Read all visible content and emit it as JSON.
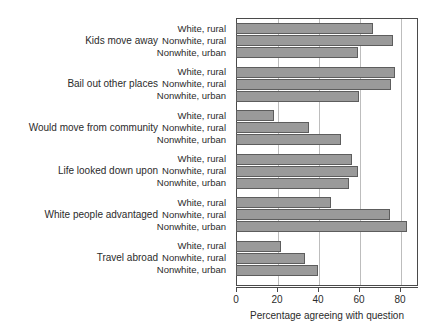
{
  "chart_data": {
    "type": "bar",
    "orientation": "horizontal",
    "title": "",
    "subtitle": "",
    "xlabel": "Percentage agreeing with question",
    "ylabel": "",
    "xlim": [
      0,
      88.9
    ],
    "xticks": [
      0,
      20,
      40,
      60,
      80
    ],
    "xticklabels": [
      "0",
      "20",
      "40",
      "60",
      "80"
    ],
    "grid": "vertical",
    "legend": "none",
    "bar_color": "#9a9a9a",
    "bar_edge_color": "#5d5d5d",
    "axis_color": "#4a4a4a",
    "gridline_color": "#bdbdbd",
    "series": [
      {
        "name": "White, rural",
        "values": [
          67,
          77.5,
          18.5,
          56.5,
          46.5,
          22
        ]
      },
      {
        "name": "Nonwhite, rural",
        "values": [
          76.5,
          75.5,
          35.5,
          59.5,
          75,
          33.5
        ]
      },
      {
        "name": "Nonwhite, urban",
        "values": [
          59.5,
          60,
          51,
          55,
          83.5,
          40
        ]
      }
    ],
    "categories": [
      "Kids move away",
      "Bail out other places",
      "Would move from community",
      "Life looked down upon",
      "White people advantaged",
      "Travel abroad"
    ],
    "groups": [
      {
        "label": "Kids move away",
        "bars": [
          {
            "series": "White, rural",
            "value": 67
          },
          {
            "series": "Nonwhite, rural",
            "value": 76.5
          },
          {
            "series": "Nonwhite, urban",
            "value": 59.5
          }
        ]
      },
      {
        "label": "Bail out other places",
        "bars": [
          {
            "series": "White, rural",
            "value": 77.5
          },
          {
            "series": "Nonwhite, rural",
            "value": 75.5
          },
          {
            "series": "Nonwhite, urban",
            "value": 60
          }
        ]
      },
      {
        "label": "Would move from community",
        "bars": [
          {
            "series": "White, rural",
            "value": 18.5
          },
          {
            "series": "Nonwhite, rural",
            "value": 35.5
          },
          {
            "series": "Nonwhite, urban",
            "value": 51
          }
        ]
      },
      {
        "label": "Life looked down upon",
        "bars": [
          {
            "series": "White, rural",
            "value": 56.5
          },
          {
            "series": "Nonwhite, rural",
            "value": 59.5
          },
          {
            "series": "Nonwhite, urban",
            "value": 55
          }
        ]
      },
      {
        "label": "White people advantaged",
        "bars": [
          {
            "series": "White, rural",
            "value": 46.5
          },
          {
            "series": "Nonwhite, rural",
            "value": 75
          },
          {
            "series": "Nonwhite, urban",
            "value": 83.5
          }
        ]
      },
      {
        "label": "Travel abroad",
        "bars": [
          {
            "series": "White, rural",
            "value": 22
          },
          {
            "series": "Nonwhite, rural",
            "value": 33.5
          },
          {
            "series": "Nonwhite, urban",
            "value": 40
          }
        ]
      }
    ]
  }
}
